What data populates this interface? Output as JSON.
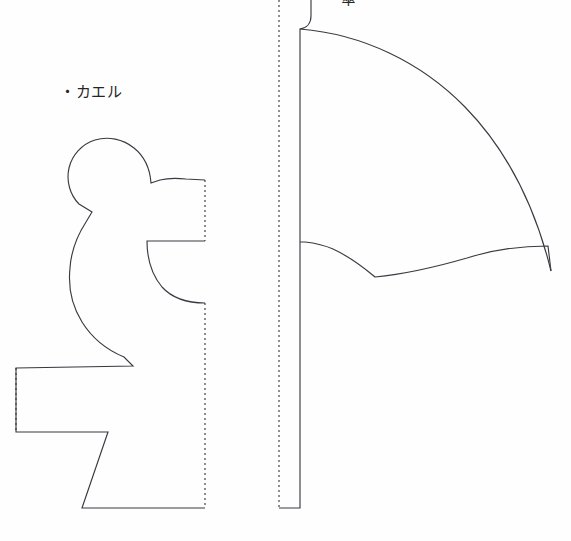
{
  "page": {
    "width": 571,
    "height": 541,
    "background_color": "#fefefe",
    "line_color": "#3a3a42",
    "text_color": "#262626"
  },
  "labels": {
    "frog": "・カエル",
    "umbrella": "・傘"
  },
  "patterns": [
    {
      "name": "frog",
      "label": "・カエル",
      "description": "Half silhouette of a seated frog with a straight dotted fold line on the right side",
      "fold_line_side": "right",
      "bounding_box": {
        "x": 16,
        "y": 140,
        "width": 190,
        "height": 370
      }
    },
    {
      "name": "umbrella",
      "label": "・傘",
      "description": "Half silhouette of an open umbrella with scalloped canopy edge and a straight handle, dotted fold line on the left side",
      "fold_line_side": "left",
      "bounding_box": {
        "x": 279,
        "y": 0,
        "width": 272,
        "height": 511
      }
    }
  ],
  "geometry": {
    "frog": {
      "cut_path": "M 205 180 L 186 179 L 172 178 L 159 180 L 150 183 C 149 168 142 155 130 148 C 118 141 104 140 92 145 C 80 150 72 161 70 174 C 68 187 73 200 83 208 L 92 211 L 88 219 C 79 232 73 247 71 263 C 69 281 72 299 80 315 C 88 331 101 344 117 353 L 130 360 L 132 367 L 16 368 L 16 432 L 108 432 L 82 508 L 205 508",
      "cut_path_secondary": "M 205 241 L 146 241 C 146 265 155 283 170 292 C 180 298 192 301 205 302",
      "fold_lines": [
        "M 205 180 L 205 241",
        "M 205 302 L 205 508",
        "M 16 368 L 16 432"
      ]
    },
    "umbrella": {
      "cut_path": "M 310 0 L 310 14 C 310 22 306 27 299 28 L 299 242 L 299 508 L 279 508",
      "canopy_path": "M 299 28 C 360 33 418 60 462 104 C 506 148 533 207 538 270 L 531 256 C 524 248 516 247 509 254 L 495 268 L 489 261 C 470 238 446 222 418 245 C 404 256 390 265 374 277 C 360 262 345 250 328 243 L 305 242",
      "fold_lines": [
        "M 279 0 L 279 508"
      ]
    }
  }
}
